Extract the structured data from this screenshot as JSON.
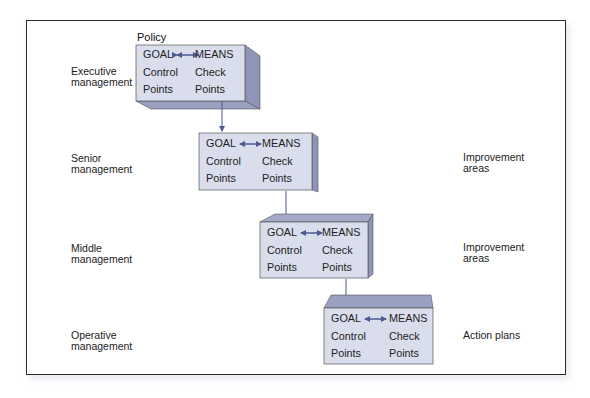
{
  "diagram": {
    "policy_label": "Policy",
    "levels": [
      {
        "left_label": "Executive\nmanagement",
        "right_label": "",
        "box": {
          "goal": "GOAL",
          "means": "MEANS",
          "left_line2": "Control",
          "left_line3": "Points",
          "right_line2": "Check",
          "right_line3": "Points"
        }
      },
      {
        "left_label": "Senior\nmanagement",
        "right_label": "Improvement\nareas",
        "box": {
          "goal": "GOAL",
          "means": "MEANS",
          "left_line2": "Control",
          "left_line3": "Points",
          "right_line2": "Check",
          "right_line3": "Points"
        }
      },
      {
        "left_label": "Middle\nmanagement",
        "right_label": "Improvement\nareas",
        "box": {
          "goal": "GOAL",
          "means": "MEANS",
          "left_line2": "Control",
          "left_line3": "Points",
          "right_line2": "Check",
          "right_line3": "Points"
        }
      },
      {
        "left_label": "Operative\nmanagement",
        "right_label": "Action plans",
        "box": {
          "goal": "GOAL",
          "means": "MEANS",
          "left_line2": "Control",
          "left_line3": "Points",
          "right_line2": "Check",
          "right_line3": "Points"
        }
      }
    ],
    "icons": {
      "goal_means_connector": "double-headed-arrow",
      "level_connector": "down-arrow"
    },
    "colors": {
      "box_front": "#d9ddec",
      "box_side": "#8f95b6",
      "box_top": "#a4aac6",
      "arrow": "#4a5a8c",
      "frame": "#2a2a2a"
    }
  }
}
